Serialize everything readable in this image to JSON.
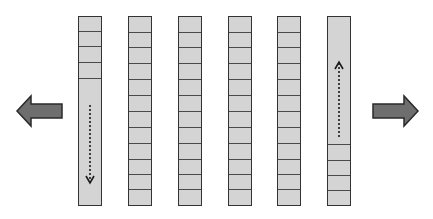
{
  "diagram": {
    "colors": {
      "cell_fill": "#d4d4d4",
      "cell_border": "#333333",
      "arrow_fill": "#6e6e6e",
      "arrow_border": "#2a2a2a",
      "dotted_arrow": "#1a1a1a"
    },
    "left_arrow": {
      "direction": "left"
    },
    "right_arrow": {
      "direction": "right"
    },
    "columns": [
      {
        "x": 78,
        "cells_top": 4,
        "merged": "bottom",
        "dotted_arrow": "down"
      },
      {
        "x": 128,
        "cells": 12
      },
      {
        "x": 178,
        "cells": 12
      },
      {
        "x": 228,
        "cells": 12
      },
      {
        "x": 277,
        "cells": 12
      },
      {
        "x": 327,
        "cells_bottom": 4,
        "merged": "top",
        "dotted_arrow": "up"
      }
    ]
  }
}
